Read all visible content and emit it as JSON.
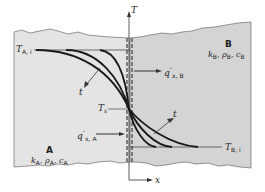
{
  "diagram": {
    "type": "interface-heat-transfer",
    "colors": {
      "medium_A": "#e4e4e4",
      "medium_B": "#d4d4d4",
      "curves": "#1a1a1a",
      "interface": "#555555"
    },
    "axes": {
      "vertical": {
        "label": "T"
      },
      "horizontal": {
        "label": "x"
      }
    },
    "labels": {
      "T_A_i": {
        "main": "T",
        "sub": "A, i"
      },
      "T_B_i": {
        "main": "T",
        "sub": "B, i"
      },
      "T_s": {
        "main": "T",
        "sub": "s"
      },
      "t_upper": "t",
      "t_lower": "t",
      "q_A": {
        "main": "q",
        "sup": "″",
        "sub": "x, A"
      },
      "q_B": {
        "main": "q",
        "sup": "″",
        "sub": "x, B"
      }
    },
    "media": {
      "A": {
        "name": "A",
        "props": [
          "k",
          "ρ",
          "c"
        ],
        "sub": "A"
      },
      "B": {
        "name": "B",
        "props": [
          "k",
          "ρ",
          "c"
        ],
        "sub": "B"
      }
    }
  }
}
